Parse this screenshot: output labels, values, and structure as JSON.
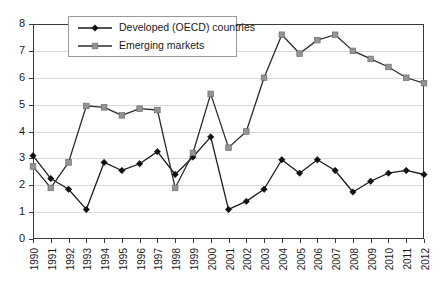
{
  "chart_data": {
    "type": "line",
    "title": "",
    "subtitle": "",
    "xlabel": "",
    "ylabel": "",
    "xlim": [
      1990,
      2012
    ],
    "ylim": [
      0,
      8
    ],
    "ytick_step": 1,
    "grid": true,
    "grid_axis": "y",
    "legend_position": "top-left-inside",
    "categories": [
      "1990",
      "1991",
      "1992",
      "1993",
      "1994",
      "1995",
      "1996",
      "1997",
      "1998",
      "1999",
      "2000",
      "2001",
      "2002",
      "2003",
      "2004",
      "2005",
      "2006",
      "2007",
      "2008",
      "2009",
      "2010",
      "2011",
      "2012"
    ],
    "ytick_labels": [
      "0",
      "1",
      "2",
      "3",
      "4",
      "5",
      "6",
      "7",
      "8"
    ],
    "series": [
      {
        "name": "Developed (OECD) countries",
        "marker": "diamond",
        "color": "#111111",
        "values": [
          3.1,
          2.25,
          1.85,
          1.1,
          2.85,
          2.55,
          2.8,
          3.25,
          2.4,
          3.05,
          3.8,
          1.1,
          1.4,
          1.85,
          2.95,
          2.45,
          2.95,
          2.55,
          1.75,
          2.15,
          2.45,
          2.55,
          2.4
        ]
      },
      {
        "name": "Emerging markets",
        "marker": "square",
        "color": "#949494",
        "values": [
          2.7,
          1.9,
          2.85,
          4.95,
          4.9,
          4.6,
          4.85,
          4.8,
          1.9,
          3.2,
          5.4,
          3.4,
          4.0,
          6.0,
          7.6,
          6.9,
          7.4,
          7.6,
          7.0,
          6.7,
          6.4,
          6.0,
          5.8
        ]
      }
    ]
  },
  "legend": {
    "entries": [
      {
        "label": "Developed (OECD) countries"
      },
      {
        "label": "Emerging markets"
      }
    ]
  }
}
